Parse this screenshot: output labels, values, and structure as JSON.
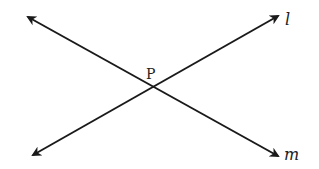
{
  "diagram": {
    "type": "intersecting-lines",
    "colors": {
      "line": "#1a1a1a",
      "background": "#ffffff",
      "text": "#222222"
    },
    "intersection": {
      "label": "P",
      "x": 151,
      "y": 87
    },
    "lines": [
      {
        "name": "l",
        "label": "l",
        "from": [
          33,
          155
        ],
        "to": [
          278,
          16
        ]
      },
      {
        "name": "m",
        "label": "m",
        "from": [
          28,
          17
        ],
        "to": [
          278,
          156
        ]
      }
    ]
  }
}
